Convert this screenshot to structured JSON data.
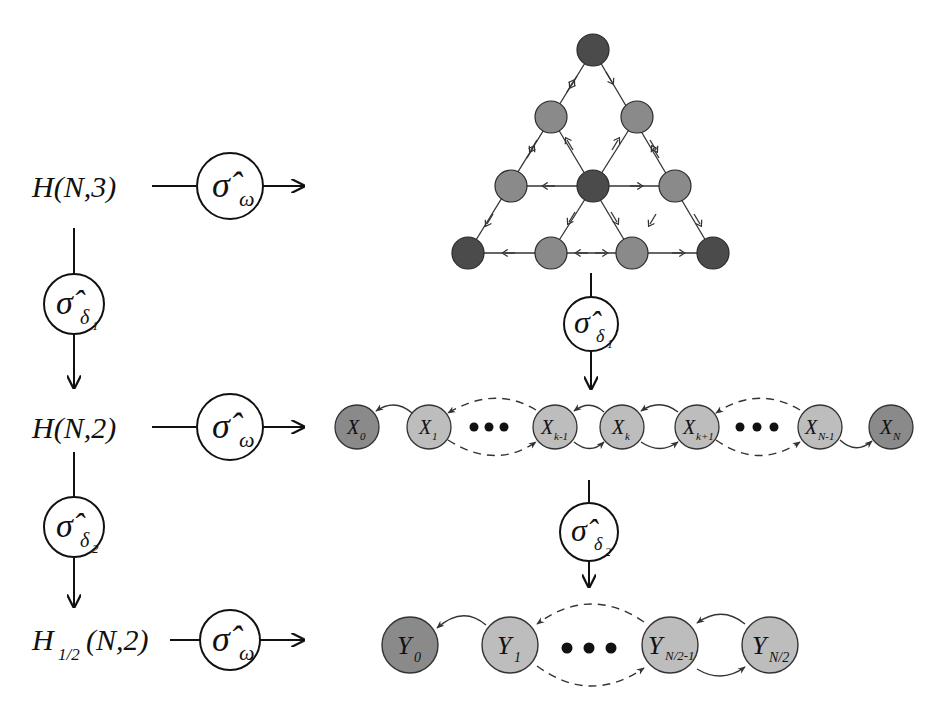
{
  "colors": {
    "dark_node": "#4b4b4b",
    "mid_node": "#8a8a8a",
    "light_node": "#b9b9b9",
    "line": "#222222",
    "edge": "#333333"
  },
  "left_column": {
    "rows": [
      {
        "label": "H(N,3)",
        "operator": "σ̂",
        "operator_sub": "ω"
      },
      {
        "label": "H(N,2)",
        "operator": "σ̂",
        "operator_sub": "ω"
      },
      {
        "label_main": "H",
        "label_sub": "1/2",
        "label_rest": "(N,2)",
        "operator": "σ̂",
        "operator_sub": "ω"
      }
    ],
    "vertical_ops": [
      {
        "operator": "σ̂",
        "sub": "δ",
        "subsub": "1"
      },
      {
        "operator": "σ̂",
        "sub": "δ",
        "subsub": "2"
      }
    ]
  },
  "triangle_lattice": {
    "node_count": 10,
    "description": "triangular lattice H(N,3) with dark corner/center nodes"
  },
  "right_vertical_ops": [
    {
      "operator": "σ̂",
      "sub": "δ",
      "subsub": "1"
    },
    {
      "operator": "σ̂",
      "sub": "δ",
      "subsub": "2"
    }
  ],
  "x_chain": {
    "nodes": [
      {
        "main": "X",
        "sub": "0"
      },
      {
        "main": "X",
        "sub": "1"
      },
      {
        "main": "X",
        "sub": "k-1"
      },
      {
        "main": "X",
        "sub": "k"
      },
      {
        "main": "X",
        "sub": "k+1"
      },
      {
        "main": "X",
        "sub": "N-1"
      },
      {
        "main": "X",
        "sub": "N"
      }
    ],
    "ellipsis": "• • •"
  },
  "y_chain": {
    "nodes": [
      {
        "main": "Y",
        "sub": "0"
      },
      {
        "main": "Y",
        "sub": "1"
      },
      {
        "main": "Y",
        "sub": "N/2-1"
      },
      {
        "main": "Y",
        "sub": "N/2"
      }
    ]
  }
}
